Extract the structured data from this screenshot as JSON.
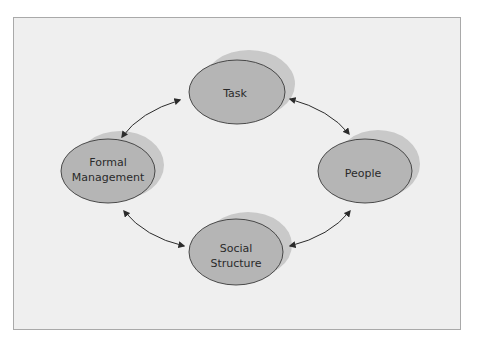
{
  "diagram": {
    "frame": {
      "x": 13,
      "y": 17,
      "width": 447,
      "height": 312,
      "fill": "#efefef",
      "stroke": "#a9a9a9"
    },
    "colors": {
      "node_fill": "#b5b5b5",
      "node_shadow": "#c9c9c9",
      "node_stroke": "#3a3a3a",
      "arrow": "#2b2b2b"
    },
    "nodes": [
      {
        "id": "task",
        "lines": [
          "Task"
        ],
        "cx": 237,
        "cy": 92,
        "rx": 48,
        "ry": 32
      },
      {
        "id": "formal-management",
        "lines": [
          "Formal",
          "Management"
        ],
        "cx": 108,
        "cy": 171,
        "rx": 47,
        "ry": 32
      },
      {
        "id": "people",
        "lines": [
          "People"
        ],
        "cx": 366,
        "cy": 171,
        "rx": 47,
        "ry": 32
      },
      {
        "id": "social-structure",
        "lines": [
          "Social",
          "Structure"
        ],
        "cx": 237,
        "cy": 252,
        "rx": 47,
        "ry": 32
      }
    ],
    "edges": [
      {
        "from": "task",
        "to": "formal-management",
        "bidirectional": true
      },
      {
        "from": "task",
        "to": "people",
        "bidirectional": true
      },
      {
        "from": "formal-management",
        "to": "social-structure",
        "bidirectional": true
      },
      {
        "from": "people",
        "to": "social-structure",
        "bidirectional": true
      }
    ],
    "labels": {
      "task": "Task",
      "formal_line1": "Formal",
      "formal_line2": "Management",
      "people": "People",
      "social_line1": "Social",
      "social_line2": "Structure"
    }
  }
}
